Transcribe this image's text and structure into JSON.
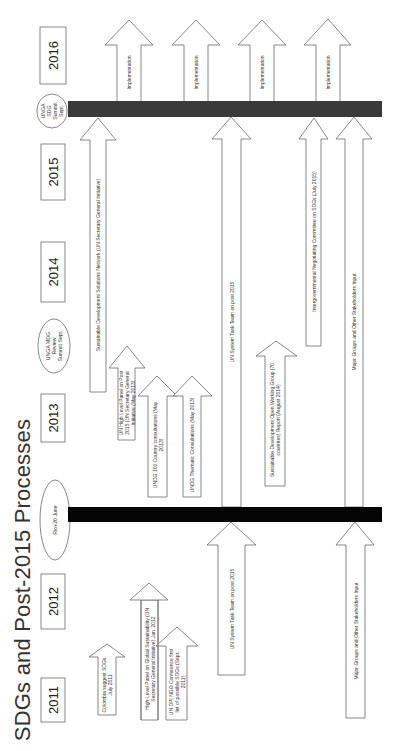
{
  "title": "SDGs and Post-2015 Processes",
  "orientation": "rotated 90° counter-clockwise; timeline runs bottom (2011) to top (2016)",
  "years": [
    "2011",
    "2012",
    "2013",
    "2014",
    "2015",
    "2016"
  ],
  "milestones": {
    "rio": "Rio+20 June",
    "mdg_review": "UNGA MDG Review Summit Sept.",
    "sdg_summit": "UNGA SDG Summit Sept."
  },
  "arrows": {
    "colombia": "Colombia suggest SDGs July 2011",
    "high_level_panel_gs": "High-Level Panel on Global Sustainability (UN Secretary General Initiative) Jan. 2012",
    "un_dpi_ngo": "UN DPI NGO Conference first list of possible SDGs (Sept. 2011)",
    "un_task_team_pre": "UN System Task Team on post 2015",
    "major_groups_pre": "Major Groups and Other Stakeholders Input",
    "sdsn": "Sustainable Development Solutions Network (UN Secretary General Initiative)",
    "un_hlp_post2015": "UN High Level Panel on Post 2015 (UN Secretary General Initiative (May 2013)",
    "undg_country": "UNDG 100 Country consultations (May 2013)",
    "undg_thematic": "UNDG Thematic Consultations (May 2013)",
    "un_task_team_post": "UN System Task Team on post 2015",
    "owg": "Sustainable Development Open Working Group (70 countries) Report (August 2014)",
    "intergov": "Intergovernmental Negotiating Committee on SDGs (July 2015)",
    "major_groups_post": "Major Groups and Other Stakeholders Input",
    "implementation": [
      "Implementation",
      "Implementation",
      "Implementation",
      "Implementation"
    ]
  },
  "colors": {
    "top_bar": "#3a3a3a",
    "bottom_bar": "#050505",
    "outline": "#555555"
  }
}
